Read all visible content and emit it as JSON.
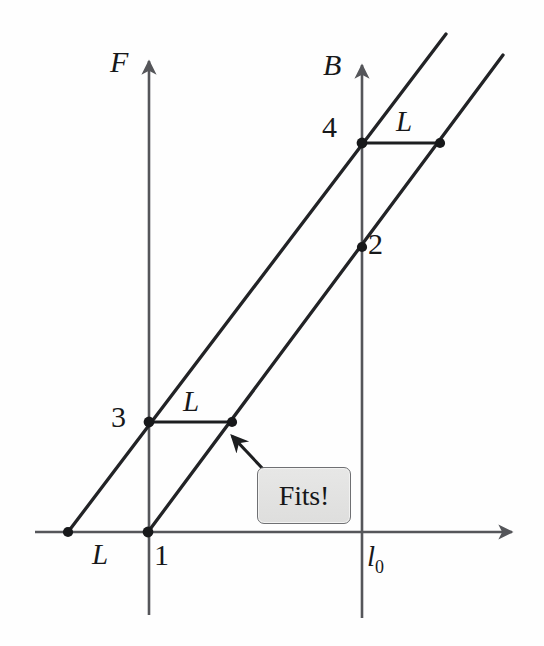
{
  "figure": {
    "background_color": "#fefefe",
    "stroke_color": "#2b2c2e",
    "axis_color": "#55565a"
  },
  "axes": {
    "horizontal": {
      "name": "x-axis",
      "from": [
        35,
        532
      ],
      "to": [
        517,
        532
      ],
      "arrow": "right"
    },
    "vertical_left": {
      "name": "F-axis",
      "label": "F",
      "x": 149,
      "top": 55,
      "bottom": 615,
      "arrow": "up",
      "label_pos": [
        112,
        48
      ]
    },
    "vertical_right": {
      "name": "B-axis",
      "label": "B",
      "x": 362,
      "top": 59,
      "bottom": 618,
      "arrow": "up",
      "label_pos": [
        325,
        51
      ]
    }
  },
  "lines": [
    {
      "name": "line-through-L-3-4",
      "from": [
        68,
        532
      ],
      "to": [
        446,
        34
      ]
    },
    {
      "name": "line-through-1-2",
      "from": [
        148,
        532
      ],
      "to": [
        503,
        55
      ]
    }
  ],
  "segments": [
    {
      "name": "segment-L-lower",
      "label": "L",
      "from": [
        149,
        422
      ],
      "to": [
        232,
        422
      ],
      "label_pos": [
        183,
        389
      ]
    },
    {
      "name": "segment-L-upper",
      "label": "L",
      "from": [
        362,
        143
      ],
      "to": [
        440,
        143
      ],
      "label_pos": [
        397,
        109
      ]
    }
  ],
  "points": [
    {
      "name": "point-L-origin",
      "label": "L",
      "x": 68,
      "y": 532,
      "label_pos": [
        94,
        541
      ]
    },
    {
      "name": "point-1",
      "label": "1",
      "x": 148,
      "y": 532,
      "label_pos": [
        154,
        541
      ]
    },
    {
      "name": "point-3",
      "label": "3",
      "x": 149,
      "y": 422,
      "label_pos": [
        114,
        403
      ]
    },
    {
      "name": "point-L-lower-end",
      "label": "",
      "x": 232,
      "y": 422,
      "label_pos": [
        0,
        0
      ]
    },
    {
      "name": "point-4",
      "label": "4",
      "x": 362,
      "y": 143,
      "label_pos": [
        326,
        113
      ]
    },
    {
      "name": "point-L-upper-end",
      "label": "",
      "x": 440,
      "y": 143,
      "label_pos": [
        0,
        0
      ]
    },
    {
      "name": "point-2",
      "label": "2",
      "x": 362,
      "y": 247,
      "label_pos": [
        369,
        229
      ]
    }
  ],
  "tick_labels": [
    {
      "name": "tick-l0",
      "text": "l",
      "sub": "0",
      "pos": [
        368,
        544
      ]
    }
  ],
  "callout": {
    "name": "fits-callout",
    "text": "Fits!",
    "box": {
      "x": 257,
      "y": 467,
      "width": 94,
      "height": 57
    },
    "fill": "#e3e3e2",
    "border": "#6f7073",
    "arrow": {
      "from": [
        263,
        469
      ],
      "to": [
        229,
        433
      ]
    }
  }
}
